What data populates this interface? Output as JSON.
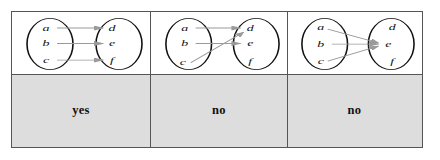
{
  "figure": {
    "domain_elements": [
      "a",
      "b",
      "c"
    ],
    "codomain_elements": [
      "d",
      "e",
      "f"
    ],
    "colors": {
      "border": "#555555",
      "ellipse_stroke": "#111111",
      "arrow": "#9a9a9a",
      "label_bar_background": "#dddddd",
      "label_text": "#111111",
      "page_background": "#ffffff"
    },
    "panels": [
      {
        "id": "panel-1",
        "label": "yes",
        "left_set": [
          "a",
          "b",
          "c"
        ],
        "right_set": [
          "d",
          "e",
          "f"
        ],
        "arrows": [
          {
            "from": "a",
            "to": "d"
          },
          {
            "from": "b",
            "to": "e"
          },
          {
            "from": "c",
            "to": "f"
          }
        ]
      },
      {
        "id": "panel-2",
        "label": "no",
        "left_set": [
          "a",
          "b",
          "c"
        ],
        "right_set": [
          "d",
          "e",
          "f"
        ],
        "arrows": [
          {
            "from": "a",
            "to": "d"
          },
          {
            "from": "b",
            "to": "e"
          },
          {
            "from": "c",
            "to": "d"
          }
        ]
      },
      {
        "id": "panel-3",
        "label": "no",
        "left_set": [
          "a",
          "b",
          "c"
        ],
        "right_set": [
          "d",
          "e",
          "f"
        ],
        "arrows": [
          {
            "from": "a",
            "to": "e"
          },
          {
            "from": "b",
            "to": "e"
          },
          {
            "from": "c",
            "to": "e"
          }
        ]
      }
    ]
  }
}
